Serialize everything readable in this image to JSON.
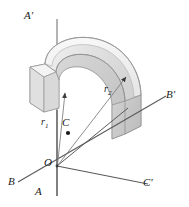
{
  "figure": {
    "background_color": "#ffffff",
    "line_color": "#6f6f6f",
    "dark_line_color": "#4a4a4a",
    "text_color": "#1a1a1a",
    "solid_fill_light": "#ececed",
    "solid_fill_mid": "#dedede",
    "solid_fill_dark": "#c9c9ca",
    "solid_fill_face": "#d4d4d5"
  },
  "axes": [
    {
      "id": "axis-a",
      "label_top": "A'",
      "label_bottom": "A",
      "orientation": "vertical"
    },
    {
      "id": "axis-b",
      "label_near": "B",
      "label_far": "B'",
      "orientation": "oblique-right-up"
    },
    {
      "id": "axis-c",
      "label_far": "C'",
      "orientation": "oblique-right-down"
    }
  ],
  "labels": {
    "a_prime": "A'",
    "a": "A",
    "b": "B",
    "b_prime": "B'",
    "c_prime": "C'",
    "origin": "O",
    "centroid": "C",
    "r1": "r",
    "r1_sub": "1",
    "r2": "r",
    "r2_sub": "2"
  },
  "points": [
    {
      "name": "origin",
      "label": "O",
      "x": 57,
      "y": 166
    },
    {
      "name": "centroid",
      "label": "C",
      "x": 68,
      "y": 131
    }
  ],
  "dimensions": {
    "width": 189,
    "height": 207
  }
}
